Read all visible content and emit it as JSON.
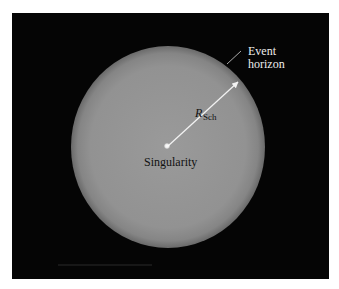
{
  "figure": {
    "labels": {
      "event_horizon_line1": "Event",
      "event_horizon_line2": "horizon",
      "radius_main": "R",
      "radius_sub": "Sch",
      "singularity": "Singularity"
    },
    "colors": {
      "background": "#050505",
      "sphere_center": "#9a9a9a",
      "sphere_edge": "#6a6a6a",
      "arrow": "#f2f2f2",
      "label_dark": "#111111",
      "label_light": "#eeeeee"
    }
  }
}
